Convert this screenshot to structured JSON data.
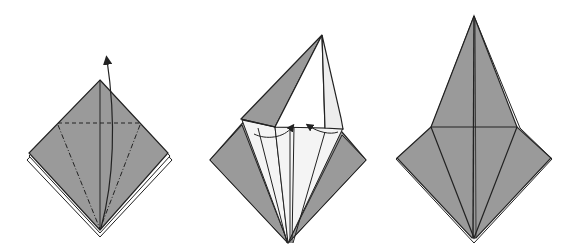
{
  "diagram": {
    "type": "origami-instructions",
    "colors": {
      "paper_colored": "#9a9a9a",
      "paper_white": "#f4f4f4",
      "line": "#222222",
      "background": "#ffffff"
    },
    "steps": [
      {
        "index": 1,
        "description": "Square base with dashed valley-fold lines and a curved arrow lifting the bottom point upward (petal fold).",
        "elements": [
          "square-base",
          "horizontal-dashed-fold-line",
          "diagonal-dashed-fold-lines",
          "curved-up-arrow"
        ]
      },
      {
        "index": 2,
        "description": "Petal fold in progress: the front layer is lifted up with its sides collapsing inward; two small arrows point toward the center.",
        "elements": [
          "lifted-flap",
          "collapsing-sides",
          "inward-arrows"
        ]
      },
      {
        "index": 3,
        "description": "Completed petal fold (bird base front): a tall kite shape above a wider lower diamond.",
        "elements": [
          "kite-flap",
          "horizontal-crease",
          "center-crease"
        ]
      }
    ]
  }
}
